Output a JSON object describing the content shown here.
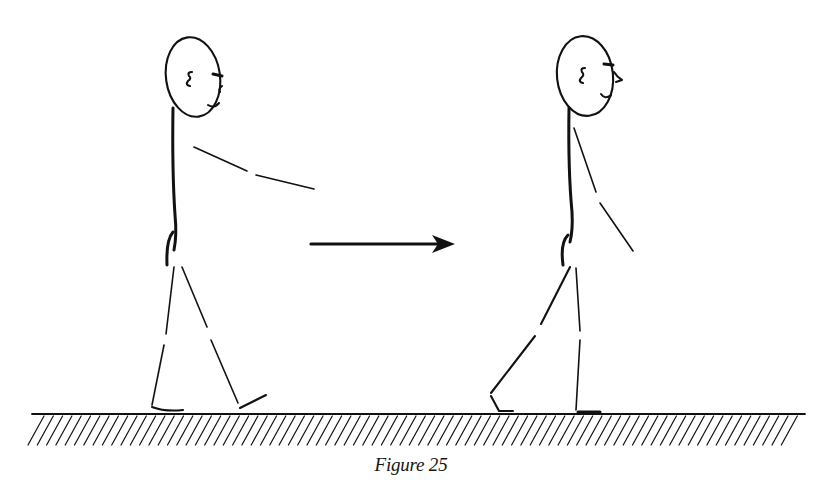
{
  "figure": {
    "caption": "Figure 25",
    "ink_color": "#111111",
    "background": "#ffffff",
    "elements": {
      "left_figure": {
        "label": "walking-figure-arm-forward"
      },
      "arrow": {
        "label": "direction-arrow",
        "direction": "right"
      },
      "right_figure": {
        "label": "walking-figure-arm-down"
      },
      "ground": {
        "label": "hatched-ground"
      }
    }
  }
}
